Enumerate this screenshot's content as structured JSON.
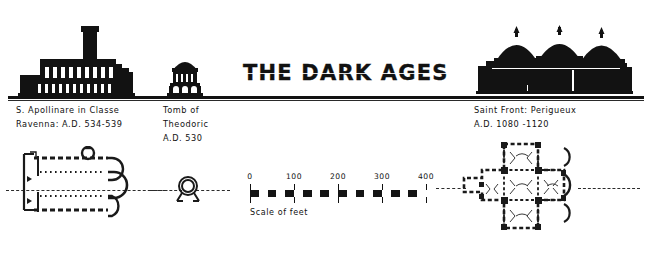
{
  "plate": {
    "title": "THE DARK AGES",
    "ground_line_color": "#121212",
    "ink_color": "#111111",
    "background_color": "#ffffff"
  },
  "entries": [
    {
      "id": "s-apollinare-in-classe",
      "name_line_1": "S. Apollinare in Classe",
      "name_line_2": "Ravenna: A.D. 534-539",
      "name_line_3": "",
      "elevation_icon": "basilica-with-campanile-silhouette",
      "plan_icon": "three-aisled-basilica-plan"
    },
    {
      "id": "tomb-of-theodoric",
      "name_line_1": "Tomb  of",
      "name_line_2": "Theodoric",
      "name_line_3": "A.D. 530",
      "elevation_icon": "rotunda-with-monolithic-dome-silhouette",
      "plan_icon": "circular-decagon-plan"
    },
    {
      "id": "saint-front-perigueux",
      "name_line_1": "Saint Front:   Perigueux",
      "name_line_2": "A.D.  1080 -1120",
      "name_line_3": "",
      "elevation_icon": "five-domed-church-silhouette",
      "plan_icon": "greek-cross-five-dome-plan"
    }
  ],
  "scale": {
    "caption": "Scale of feet",
    "ticks": [
      "0",
      "100",
      "200",
      "300",
      "400"
    ],
    "min": 0,
    "max": 400,
    "segments": 20
  }
}
